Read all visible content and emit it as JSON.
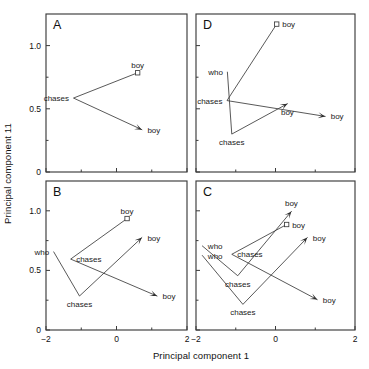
{
  "figure": {
    "xlabel": "Principal component 1",
    "ylabel": "Principal component 11"
  },
  "chart_data": {
    "type": "scatter",
    "title": "",
    "xlabel": "Principal component 1",
    "ylabel": "Principal component 11",
    "xlim": [
      -2,
      2
    ],
    "ylim": [
      0,
      1.25
    ],
    "xticks": [
      -2,
      0,
      2
    ],
    "xticklabels": [
      "−2",
      "0",
      "2"
    ],
    "xminorticks": [
      -1,
      1
    ],
    "yticks": [
      0,
      0.5,
      1.0
    ],
    "yticklabels": [
      "0",
      "0.5",
      "1.0"
    ],
    "yminorticks": [
      0.25,
      0.75
    ],
    "grid": false,
    "legend": null,
    "panels": [
      {
        "letter": "A",
        "position": "top-left",
        "paths": [
          {
            "name": "trajectory-1",
            "points": [
              {
                "x": 0.6,
                "y": 0.785,
                "label": "boy",
                "marker": "square",
                "label_pos": "above"
              },
              {
                "x": -1.22,
                "y": 0.585,
                "label": "chases",
                "marker": "none",
                "label_pos": "left"
              },
              {
                "x": 0.72,
                "y": 0.335,
                "label": "boy",
                "marker": "arrow",
                "label_pos": "right"
              }
            ]
          }
        ]
      },
      {
        "letter": "D",
        "position": "top-right",
        "paths": [
          {
            "name": "trajectory-1",
            "points": [
              {
                "x": 0.03,
                "y": 1.17,
                "label": "boy",
                "marker": "square",
                "label_pos": "right"
              },
              {
                "x": -1.22,
                "y": 0.565,
                "label": "chases",
                "marker": "none",
                "label_pos": "left"
              },
              {
                "x": 1.25,
                "y": 0.44,
                "label": "boy",
                "marker": "arrow",
                "label_pos": "right"
              }
            ]
          },
          {
            "name": "trajectory-2",
            "points": [
              {
                "x": -1.21,
                "y": 0.79,
                "label": "who",
                "marker": "none",
                "label_pos": "left"
              },
              {
                "x": -1.1,
                "y": 0.3,
                "label": "chases",
                "marker": "none",
                "label_pos": "below"
              },
              {
                "x": 0.3,
                "y": 0.54,
                "label": "boy",
                "marker": "arrow",
                "label_pos": "below"
              }
            ]
          }
        ]
      },
      {
        "letter": "B",
        "position": "bottom-left",
        "paths": [
          {
            "name": "trajectory-1",
            "points": [
              {
                "x": 0.3,
                "y": 0.935,
                "label": "boy",
                "marker": "square",
                "label_pos": "above"
              },
              {
                "x": -1.3,
                "y": 0.595,
                "label": "chases",
                "marker": "none",
                "label_pos": "right"
              },
              {
                "x": 1.15,
                "y": 0.285,
                "label": "boy",
                "marker": "arrow",
                "label_pos": "right"
              }
            ]
          },
          {
            "name": "trajectory-2",
            "points": [
              {
                "x": -1.78,
                "y": 0.655,
                "label": "who",
                "marker": "none",
                "label_pos": "left"
              },
              {
                "x": -1.05,
                "y": 0.285,
                "label": "chases",
                "marker": "none",
                "label_pos": "below"
              },
              {
                "x": 0.72,
                "y": 0.775,
                "label": "boy",
                "marker": "arrow",
                "label_pos": "right"
              }
            ]
          }
        ]
      },
      {
        "letter": "C",
        "position": "bottom-right",
        "paths": [
          {
            "name": "trajectory-1",
            "points": [
              {
                "x": 0.28,
                "y": 0.885,
                "label": "boy",
                "marker": "square",
                "label_pos": "right"
              },
              {
                "x": -1.1,
                "y": 0.635,
                "label": "chases",
                "marker": "none",
                "label_pos": "right"
              },
              {
                "x": 1.05,
                "y": 0.255,
                "label": "boy",
                "marker": "arrow",
                "label_pos": "right"
              }
            ]
          },
          {
            "name": "trajectory-2",
            "points": [
              {
                "x": -1.84,
                "y": 0.705,
                "label": "who",
                "marker": "none",
                "label_pos": "right"
              },
              {
                "x": -0.95,
                "y": 0.455,
                "label": "chases",
                "marker": "none",
                "label_pos": "below"
              },
              {
                "x": 0.4,
                "y": 0.995,
                "label": "boy",
                "marker": "arrow",
                "label_pos": "above"
              }
            ]
          },
          {
            "name": "trajectory-3",
            "points": [
              {
                "x": -1.84,
                "y": 0.625,
                "label": "who",
                "marker": "none",
                "label_pos": "right"
              },
              {
                "x": -0.82,
                "y": 0.215,
                "label": "chases",
                "marker": "none",
                "label_pos": "below"
              },
              {
                "x": 0.8,
                "y": 0.775,
                "label": "boy",
                "marker": "arrow",
                "label_pos": "right"
              }
            ]
          }
        ]
      }
    ]
  }
}
